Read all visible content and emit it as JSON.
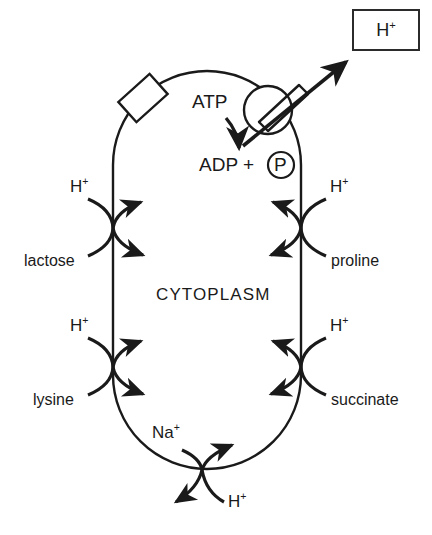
{
  "figure": {
    "cytoplasm_label": "CYTOPLASM",
    "ink_color": "#1a1a1a",
    "background_color": "#ffffff"
  },
  "external_box": {
    "label": "H",
    "superscript": "+",
    "name": "external-proton-pool"
  },
  "atpase": {
    "substrate_label": "ATP",
    "product_label": "ADP +",
    "phosphate_label": "P",
    "pumped_ion": "H",
    "pumped_ion_charge": "+"
  },
  "transporters": [
    {
      "id": "lactose",
      "side": "left",
      "type": "symport",
      "ion_label": "H",
      "ion_charge": "+",
      "solute_label": "lactose"
    },
    {
      "id": "lysine",
      "side": "left",
      "type": "symport",
      "ion_label": "H",
      "ion_charge": "+",
      "solute_label": "lysine"
    },
    {
      "id": "proline",
      "side": "right",
      "type": "symport",
      "ion_label": "H",
      "ion_charge": "+",
      "solute_label": "proline"
    },
    {
      "id": "succinate",
      "side": "right",
      "type": "symport",
      "ion_label": "H",
      "ion_charge": "+",
      "solute_label": "succinate"
    },
    {
      "id": "sodium-proton",
      "side": "bottom",
      "type": "antiport",
      "ion_label": "Na",
      "ion_charge": "+",
      "solute_label": "H",
      "solute_charge": "+"
    }
  ]
}
